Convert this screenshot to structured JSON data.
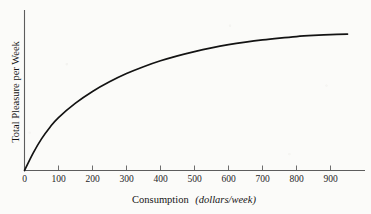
{
  "chart_data": {
    "type": "line",
    "title": "",
    "xlabel": "Consumption (dollars/week)",
    "xlabel_main": "Consumption",
    "xlabel_unit": "(dollars/week)",
    "ylabel": "Total Pleasure per Week",
    "xlim": [
      0,
      1000
    ],
    "ylim": [
      0,
      100
    ],
    "grid": false,
    "legend": null,
    "xticks": [
      0,
      100,
      200,
      300,
      400,
      500,
      600,
      700,
      800,
      900
    ],
    "xtick_labels": [
      "0",
      "100",
      "200",
      "300",
      "400",
      "500",
      "600",
      "700",
      "800",
      "900"
    ],
    "yticks": [],
    "ytick_labels": [],
    "series": [
      {
        "name": "Total Pleasure",
        "curve_color": "#131313",
        "x": [
          0,
          25,
          50,
          75,
          100,
          150,
          200,
          250,
          300,
          350,
          400,
          450,
          500,
          550,
          600,
          650,
          700,
          750,
          800,
          850,
          900,
          950
        ],
        "y": [
          0,
          12.5,
          23.0,
          31.5,
          38.5,
          49.0,
          57.5,
          64.5,
          70.5,
          75.5,
          79.8,
          83.4,
          86.5,
          89.2,
          91.5,
          93.4,
          95.0,
          96.3,
          97.4,
          98.2,
          98.8,
          99.2
        ]
      }
    ],
    "annotations": []
  },
  "figure": {
    "caption": "",
    "background_color": "#fbfbf9",
    "axis_color": "#5d5d5d",
    "curve_color": "#131313"
  }
}
